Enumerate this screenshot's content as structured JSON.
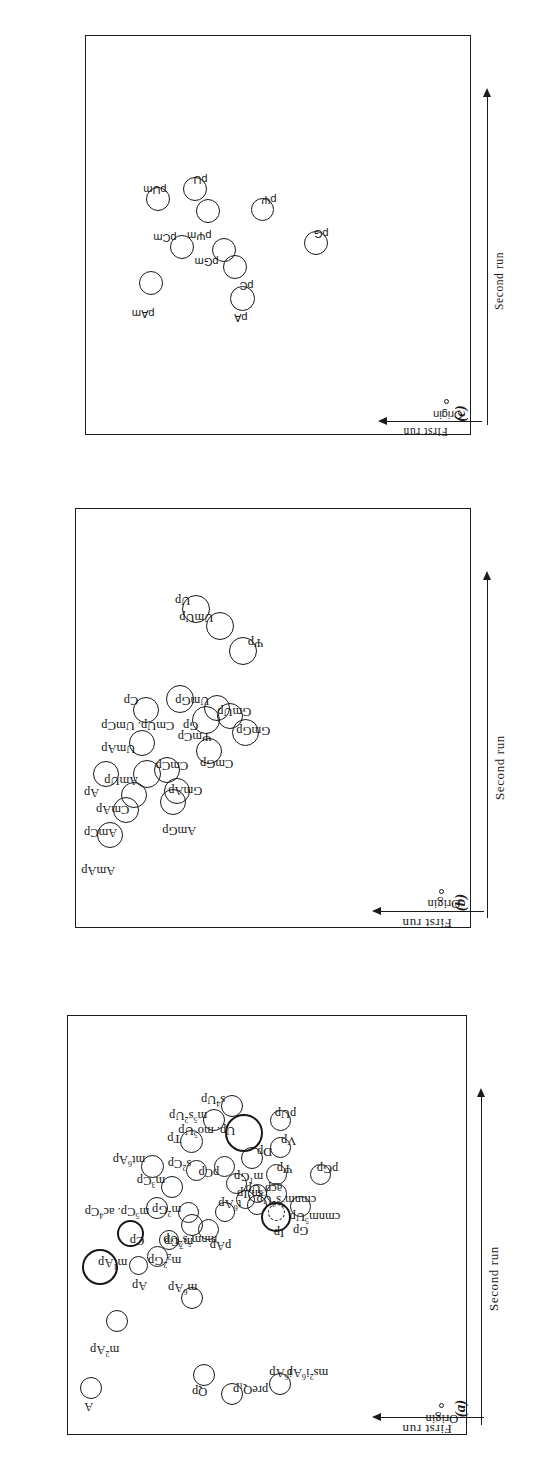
{
  "figure": {
    "type": "two-dimensional-chromatogram-map",
    "panel_count": 3,
    "axis_first_run": "First run",
    "axis_second_run": "Second run",
    "origin_label": "Origin",
    "ink_color": "#181818",
    "background_color": "#ffffff"
  },
  "chart_data": {
    "type": "scatter",
    "title": "",
    "subtitle": "",
    "xlabel": "Second run",
    "ylabel": "First run",
    "grid": false,
    "legend": null,
    "note": "Three two-dimensional thin-layer chromatography maps. Each point is a labelled nucleotide spot; x = Second run migration, y = First run migration (arbitrary units, 0-100 of plate). r = relative spot radius.",
    "panels": [
      {
        "id": "a",
        "panel_label": "(a)",
        "origin": {
          "x": 6,
          "y": 5
        },
        "points": [
          {
            "label": "A",
            "x": 11,
            "y": 92,
            "r": 11
          },
          {
            "label": "m<sup>2</sup>Ap",
            "x": 27,
            "y": 85,
            "r": 11
          },
          {
            "label": "i<sup>6</sup>Ap",
            "x": 12,
            "y": 44,
            "r": 11
          },
          {
            "label": "ms<sup>2</sup>i<sup>6</sup>Ap",
            "x": 12,
            "y": 44,
            "r": 0
          },
          {
            "label": "m<sup>6</sup>Ap",
            "x": 32,
            "y": 66,
            "r": 10
          },
          {
            "label": "Ap",
            "x": 40,
            "y": 87,
            "r": 18
          },
          {
            "label": "m<sup>1</sup>Ap",
            "x": 40,
            "y": 80,
            "r": 9
          },
          {
            "label": "m<sub>2</sub><sup>2</sup>Gp",
            "x": 42,
            "y": 75,
            "r": 10
          },
          {
            "label": "m<sup>7</sup>Gp",
            "x": 46,
            "y": 72,
            "r": 9
          },
          {
            "label": "Qp",
            "x": 14,
            "y": 63,
            "r": 10
          },
          {
            "label": "preQ<sub>1</sub>p",
            "x": 9,
            "y": 56,
            "r": 10
          },
          {
            "label": "mnm<sup>5</sup>s<sup>2</sup>Up",
            "x": 50,
            "y": 66,
            "r": 10
          },
          {
            "label": "m<sup>5</sup>Cp. ac<sup>4</sup>Cp",
            "x": 54,
            "y": 75,
            "r": 10
          },
          {
            "label": "m<sup>3</sup>Cp",
            "x": 59,
            "y": 71,
            "r": 10
          },
          {
            "label": "Cp",
            "x": 48,
            "y": 81,
            "r": 13
          },
          {
            "label": "pAp",
            "x": 49,
            "y": 62,
            "r": 10
          },
          {
            "label": "m<sup>2</sup>Gp",
            "x": 53,
            "y": 67,
            "r": 10
          },
          {
            "label": "mt<sup>6</sup>Ap",
            "x": 64,
            "y": 76,
            "r": 11
          },
          {
            "label": "t<sup>6</sup>Ap",
            "x": 53,
            "y": 58,
            "r": 9
          },
          {
            "label": "m<sup>1</sup>Ip",
            "x": 56,
            "y": 53,
            "r": 9
          },
          {
            "label": "Ip",
            "x": 55,
            "y": 50,
            "r": 12
          },
          {
            "label": "acp<sup>3</sup>Up",
            "x": 57,
            "y": 50,
            "r": 9
          },
          {
            "label": "s<sup>2</sup>Cp",
            "x": 63,
            "y": 65,
            "r": 10
          },
          {
            "label": "Tp",
            "x": 70,
            "y": 66,
            "r": 11
          },
          {
            "label": "m<sup>5</sup>s<sup>2</sup>Up",
            "x": 75,
            "y": 60,
            "r": 10
          },
          {
            "label": "s<sup>4</sup>Up",
            "x": 78,
            "y": 56,
            "r": 10
          },
          {
            "label": "m<sup>1</sup>Gp",
            "x": 60,
            "y": 55,
            "r": 10
          },
          {
            "label": "pCp",
            "x": 64,
            "y": 58,
            "r": 10
          },
          {
            "label": "Up. mo<sup>5</sup>Up",
            "x": 72,
            "y": 51,
            "r": 19
          },
          {
            "label": "Dp",
            "x": 66,
            "y": 51,
            "r": 11
          },
          {
            "label": "pUp",
            "x": 75,
            "y": 44,
            "r": 10
          },
          {
            "label": "Vp",
            "x": 68,
            "y": 44,
            "r": 10
          },
          {
            "label": "Ψp",
            "x": 62,
            "y": 45,
            "r": 10
          },
          {
            "label": "cmnm<sup>5</sup>s<sup>2</sup>Up",
            "x": 57,
            "y": 45,
            "r": 10
          },
          {
            "label": "Gp",
            "x": 52,
            "y": 44,
            "r": 15
          },
          {
            "label": "cmnm<sup>5</sup>Up",
            "x": 54,
            "y": 39,
            "r": 10
          },
          {
            "label": "pGp",
            "x": 62,
            "y": 34,
            "r": 10
          }
        ]
      },
      {
        "id": "b",
        "panel_label": "(b)",
        "origin": {
          "x": 8,
          "y": 6
        },
        "points": [
          {
            "label": "AmAp",
            "x": 22,
            "y": 88,
            "r": 13
          },
          {
            "label": "AmCp",
            "x": 28,
            "y": 84,
            "r": 13
          },
          {
            "label": "Ap",
            "x": 36,
            "y": 89,
            "r": 13
          },
          {
            "label": "CmAp",
            "x": 31,
            "y": 82,
            "r": 13
          },
          {
            "label": "AmUp",
            "x": 36,
            "y": 79,
            "r": 14
          },
          {
            "label": "UmAp",
            "x": 43,
            "y": 80,
            "r": 13
          },
          {
            "label": "AmGp",
            "x": 30,
            "y": 72,
            "r": 13
          },
          {
            "label": "GmAp",
            "x": 32,
            "y": 71,
            "r": 13
          },
          {
            "label": "CmCp",
            "x": 37,
            "y": 73,
            "r": 13
          },
          {
            "label": "Cp",
            "x": 52,
            "y": 79,
            "r": 13
          },
          {
            "label": "CmUp. UmCp",
            "x": 54,
            "y": 70,
            "r": 14
          },
          {
            "label": "CmGp",
            "x": 42,
            "y": 63,
            "r": 13
          },
          {
            "label": "Gp",
            "x": 49,
            "y": 63,
            "r": 14
          },
          {
            "label": "ΨmCp",
            "x": 49,
            "y": 63,
            "r": 0
          },
          {
            "label": "UmGp",
            "x": 52,
            "y": 61,
            "r": 13
          },
          {
            "label": "GmUp",
            "x": 50,
            "y": 58,
            "r": 13
          },
          {
            "label": "GmGp",
            "x": 46,
            "y": 54,
            "r": 14
          },
          {
            "label": "Up",
            "x": 76,
            "y": 66,
            "r": 14
          },
          {
            "label": "UmUp",
            "x": 72,
            "y": 60,
            "r": 14
          },
          {
            "label": "Ψp",
            "x": 66,
            "y": 54,
            "r": 14
          }
        ]
      },
      {
        "id": "c",
        "panel_label": "(c)",
        "origin": {
          "x": 8,
          "y": 6
        },
        "points": [
          {
            "label": "pAm",
            "x": 38,
            "y": 80,
            "r": 12
          },
          {
            "label": "pCm",
            "x": 47,
            "y": 72,
            "r": 12
          },
          {
            "label": "pUm",
            "x": 59,
            "y": 78,
            "r": 12
          },
          {
            "label": "pA",
            "x": 34,
            "y": 56,
            "r": 12
          },
          {
            "label": "pC",
            "x": 42,
            "y": 58,
            "r": 12
          },
          {
            "label": "pGm",
            "x": 44,
            "y": 60,
            "r": 12
          },
          {
            "label": "pΨm",
            "x": 56,
            "y": 65,
            "r": 12
          },
          {
            "label": "pU",
            "x": 60,
            "y": 68,
            "r": 12
          },
          {
            "label": "pΨ",
            "x": 56,
            "y": 52,
            "r": 12
          },
          {
            "label": "pG",
            "x": 48,
            "y": 38,
            "r": 12
          }
        ]
      }
    ]
  }
}
